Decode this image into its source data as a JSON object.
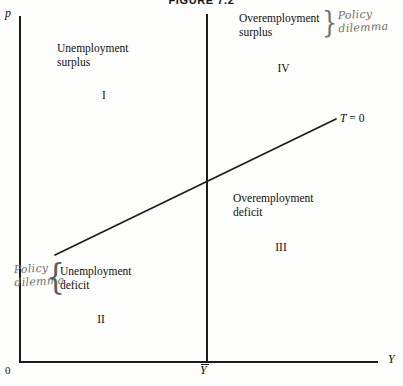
{
  "figure": {
    "title": "FIGURE 7.2"
  },
  "axes": {
    "y_axis_label": "p",
    "x_axis_label": "Y",
    "origin_label": "0",
    "full_employment_label": "Y",
    "full_employment_overbar": true
  },
  "schedule": {
    "label_symbol": "T",
    "label_rest": " = 0",
    "label_full": "T = 0",
    "start": {
      "x": 55,
      "y": 255
    },
    "end": {
      "x": 336,
      "y": 119
    }
  },
  "quadrants": [
    {
      "roman": "I",
      "line1": "Unemployment",
      "line2": "surplus"
    },
    {
      "roman": "IV",
      "line1": "Overemployment",
      "line2": "surplus"
    },
    {
      "roman": "III",
      "line1": "Overemployment",
      "line2": "deficit"
    },
    {
      "roman": "II",
      "line1": "Unemployment",
      "line2": "deficit"
    }
  ],
  "annotations": [
    {
      "id": "policy-dilemma-top-right",
      "line1": "Policy",
      "line2": "dilemma",
      "brace": "}"
    },
    {
      "id": "policy-dilemma-bottom-left",
      "line1": "Policy",
      "line2": "dilemma",
      "brace": "{"
    }
  ],
  "colors": {
    "ink": "#1c1c1c",
    "pencil": "#6d6d6d",
    "paper": "#fdfdfc"
  }
}
